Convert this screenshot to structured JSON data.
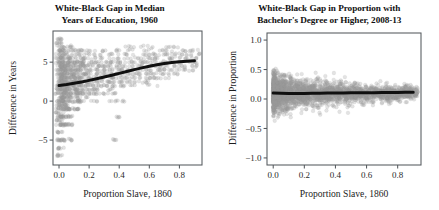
{
  "figure": {
    "width": 439,
    "height": 210,
    "background": "#ffffff",
    "point_color": "#9a9a9a",
    "point_opacity": 0.28,
    "curve_color": "#101010",
    "frame_color": "#555a5e"
  },
  "chart_data": [
    {
      "type": "scatter",
      "panel": "left",
      "title": "White-Black Gap in Median Years of Education, 1960",
      "title_lines": [
        "White-Black Gap in Median",
        "Years of Education, 1960"
      ],
      "xlabel": "Proportion Slave, 1860",
      "ylabel": "Difference in Years",
      "xlim": [
        -0.04,
        0.95
      ],
      "ylim": [
        -8.2,
        9.0
      ],
      "xticks": [
        0.0,
        0.2,
        0.4,
        0.6,
        0.8
      ],
      "xticklabels": [
        "0.0",
        "0.2",
        "0.4",
        "0.6",
        "0.8"
      ],
      "yticks": [
        5,
        0,
        -5
      ],
      "yticklabels": [
        "5",
        "0",
        "-5"
      ],
      "grid": false,
      "legend": null,
      "marker": "circle-open-gray",
      "overlay": {
        "type": "loess",
        "name": "loess smoother",
        "color": "#101010",
        "linewidth": 3.0,
        "x": [
          0.0,
          0.05,
          0.1,
          0.15,
          0.2,
          0.25,
          0.3,
          0.35,
          0.4,
          0.45,
          0.5,
          0.55,
          0.6,
          0.65,
          0.7,
          0.75,
          0.8,
          0.85,
          0.9
        ],
        "y": [
          2.0,
          2.12,
          2.28,
          2.46,
          2.66,
          2.88,
          3.1,
          3.33,
          3.56,
          3.8,
          4.04,
          4.27,
          4.48,
          4.66,
          4.82,
          4.95,
          5.05,
          5.12,
          5.18
        ]
      },
      "note": "Points lie on discrete half-year bands; density is greatest near x=0 and along y = 1 to 5.",
      "points": [
        [
          0.002,
          8.0
        ],
        [
          0.004,
          7.5
        ],
        [
          0.003,
          7.0
        ],
        [
          0.006,
          6.5
        ],
        [
          0.005,
          6.0
        ],
        [
          0.004,
          5.5
        ],
        [
          0.003,
          5.0
        ],
        [
          0.007,
          4.5
        ],
        [
          0.002,
          4.0
        ],
        [
          0.005,
          3.5
        ],
        [
          0.004,
          3.0
        ],
        [
          0.006,
          2.5
        ],
        [
          0.003,
          2.0
        ],
        [
          0.005,
          1.5
        ],
        [
          0.004,
          1.0
        ],
        [
          0.007,
          0.5
        ],
        [
          0.002,
          0.0
        ],
        [
          0.006,
          -0.5
        ],
        [
          0.004,
          -1.0
        ],
        [
          0.003,
          -1.5
        ],
        [
          0.005,
          -2.0
        ],
        [
          0.004,
          -2.5
        ],
        [
          0.006,
          -3.0
        ],
        [
          0.003,
          -4.0
        ],
        [
          0.005,
          -5.0
        ],
        [
          0.004,
          -6.0
        ],
        [
          0.006,
          -7.0
        ],
        [
          0.02,
          6.5
        ],
        [
          0.02,
          5.5
        ],
        [
          0.02,
          5.0
        ],
        [
          0.02,
          4.5
        ],
        [
          0.02,
          4.0
        ],
        [
          0.02,
          3.5
        ],
        [
          0.02,
          3.0
        ],
        [
          0.02,
          2.5
        ],
        [
          0.02,
          2.0
        ],
        [
          0.02,
          1.5
        ],
        [
          0.02,
          1.0
        ],
        [
          0.02,
          0.5
        ],
        [
          0.02,
          0.0
        ],
        [
          0.02,
          -0.5
        ],
        [
          0.02,
          -1.0
        ],
        [
          0.02,
          -2.0
        ],
        [
          0.02,
          -3.0
        ],
        [
          0.02,
          -5.0
        ],
        [
          0.04,
          6.0
        ],
        [
          0.04,
          5.0
        ],
        [
          0.04,
          4.5
        ],
        [
          0.04,
          4.0
        ],
        [
          0.04,
          3.5
        ],
        [
          0.04,
          3.0
        ],
        [
          0.04,
          2.5
        ],
        [
          0.04,
          2.0
        ],
        [
          0.04,
          1.5
        ],
        [
          0.04,
          1.0
        ],
        [
          0.04,
          0.5
        ],
        [
          0.04,
          0.0
        ],
        [
          0.04,
          -0.5
        ],
        [
          0.04,
          -1.0
        ],
        [
          0.04,
          -2.0
        ],
        [
          0.04,
          -3.0
        ],
        [
          0.06,
          7.0
        ],
        [
          0.06,
          5.5
        ],
        [
          0.06,
          5.0
        ],
        [
          0.06,
          4.5
        ],
        [
          0.06,
          4.0
        ],
        [
          0.06,
          3.5
        ],
        [
          0.06,
          3.0
        ],
        [
          0.06,
          2.5
        ],
        [
          0.06,
          2.0
        ],
        [
          0.06,
          1.5
        ],
        [
          0.06,
          1.0
        ],
        [
          0.06,
          0.5
        ],
        [
          0.06,
          0.0
        ],
        [
          0.06,
          -1.0
        ],
        [
          0.06,
          -2.0
        ],
        [
          0.06,
          -5.0
        ],
        [
          0.09,
          6.5
        ],
        [
          0.09,
          5.5
        ],
        [
          0.09,
          5.0
        ],
        [
          0.09,
          4.5
        ],
        [
          0.09,
          4.0
        ],
        [
          0.09,
          3.5
        ],
        [
          0.09,
          3.0
        ],
        [
          0.09,
          2.5
        ],
        [
          0.09,
          2.0
        ],
        [
          0.09,
          1.5
        ],
        [
          0.09,
          1.0
        ],
        [
          0.09,
          0.0
        ],
        [
          0.09,
          -1.0
        ],
        [
          0.09,
          -3.0
        ],
        [
          0.12,
          6.0
        ],
        [
          0.12,
          5.0
        ],
        [
          0.12,
          4.5
        ],
        [
          0.12,
          4.0
        ],
        [
          0.12,
          3.5
        ],
        [
          0.12,
          3.0
        ],
        [
          0.12,
          2.5
        ],
        [
          0.12,
          2.0
        ],
        [
          0.12,
          1.5
        ],
        [
          0.12,
          1.0
        ],
        [
          0.12,
          0.5
        ],
        [
          0.12,
          0.0
        ],
        [
          0.12,
          -1.0
        ],
        [
          0.15,
          6.5
        ],
        [
          0.15,
          5.5
        ],
        [
          0.15,
          5.0
        ],
        [
          0.15,
          4.5
        ],
        [
          0.15,
          4.0
        ],
        [
          0.15,
          3.5
        ],
        [
          0.15,
          3.0
        ],
        [
          0.15,
          2.5
        ],
        [
          0.15,
          2.0
        ],
        [
          0.15,
          1.5
        ],
        [
          0.15,
          1.0
        ],
        [
          0.15,
          0.0
        ],
        [
          0.18,
          6.0
        ],
        [
          0.18,
          5.0
        ],
        [
          0.18,
          4.5
        ],
        [
          0.18,
          4.0
        ],
        [
          0.18,
          3.5
        ],
        [
          0.18,
          3.0
        ],
        [
          0.18,
          2.5
        ],
        [
          0.18,
          2.0
        ],
        [
          0.18,
          1.5
        ],
        [
          0.18,
          1.0
        ],
        [
          0.18,
          0.5
        ],
        [
          0.22,
          6.5
        ],
        [
          0.22,
          5.5
        ],
        [
          0.22,
          5.0
        ],
        [
          0.22,
          4.5
        ],
        [
          0.22,
          4.0
        ],
        [
          0.22,
          3.5
        ],
        [
          0.22,
          3.0
        ],
        [
          0.22,
          2.5
        ],
        [
          0.22,
          2.0
        ],
        [
          0.22,
          1.5
        ],
        [
          0.22,
          1.0
        ],
        [
          0.22,
          0.0
        ],
        [
          0.26,
          6.0
        ],
        [
          0.26,
          5.0
        ],
        [
          0.26,
          4.5
        ],
        [
          0.26,
          4.0
        ],
        [
          0.26,
          3.5
        ],
        [
          0.26,
          3.0
        ],
        [
          0.26,
          2.5
        ],
        [
          0.26,
          2.0
        ],
        [
          0.26,
          1.5
        ],
        [
          0.26,
          1.0
        ],
        [
          0.3,
          6.5
        ],
        [
          0.3,
          5.5
        ],
        [
          0.3,
          5.0
        ],
        [
          0.3,
          4.5
        ],
        [
          0.3,
          4.0
        ],
        [
          0.3,
          3.5
        ],
        [
          0.3,
          3.0
        ],
        [
          0.3,
          2.5
        ],
        [
          0.3,
          2.0
        ],
        [
          0.3,
          1.0
        ],
        [
          0.34,
          6.0
        ],
        [
          0.34,
          5.0
        ],
        [
          0.34,
          4.5
        ],
        [
          0.34,
          4.0
        ],
        [
          0.34,
          3.5
        ],
        [
          0.34,
          3.0
        ],
        [
          0.34,
          2.5
        ],
        [
          0.34,
          2.0
        ],
        [
          0.34,
          1.5
        ],
        [
          0.34,
          0.0
        ],
        [
          0.38,
          6.5
        ],
        [
          0.38,
          5.5
        ],
        [
          0.38,
          5.0
        ],
        [
          0.38,
          4.5
        ],
        [
          0.38,
          4.0
        ],
        [
          0.38,
          3.5
        ],
        [
          0.38,
          3.0
        ],
        [
          0.38,
          2.5
        ],
        [
          0.38,
          2.0
        ],
        [
          0.38,
          1.0
        ],
        [
          0.38,
          -2.0
        ],
        [
          0.38,
          -5.0
        ],
        [
          0.42,
          6.0
        ],
        [
          0.42,
          5.0
        ],
        [
          0.42,
          4.5
        ],
        [
          0.42,
          4.0
        ],
        [
          0.42,
          3.5
        ],
        [
          0.42,
          3.0
        ],
        [
          0.42,
          2.5
        ],
        [
          0.42,
          2.0
        ],
        [
          0.42,
          0.0
        ],
        [
          0.46,
          7.0
        ],
        [
          0.46,
          5.5
        ],
        [
          0.46,
          5.0
        ],
        [
          0.46,
          4.5
        ],
        [
          0.46,
          4.0
        ],
        [
          0.46,
          3.5
        ],
        [
          0.46,
          3.0
        ],
        [
          0.46,
          2.5
        ],
        [
          0.46,
          2.0
        ],
        [
          0.5,
          6.5
        ],
        [
          0.5,
          6.0
        ],
        [
          0.5,
          5.0
        ],
        [
          0.5,
          4.5
        ],
        [
          0.5,
          4.0
        ],
        [
          0.5,
          3.5
        ],
        [
          0.5,
          3.0
        ],
        [
          0.5,
          2.5
        ],
        [
          0.54,
          7.0
        ],
        [
          0.54,
          5.5
        ],
        [
          0.54,
          5.0
        ],
        [
          0.54,
          4.5
        ],
        [
          0.54,
          4.0
        ],
        [
          0.54,
          3.5
        ],
        [
          0.54,
          3.0
        ],
        [
          0.54,
          2.5
        ],
        [
          0.58,
          6.5
        ],
        [
          0.58,
          6.0
        ],
        [
          0.58,
          5.5
        ],
        [
          0.58,
          5.0
        ],
        [
          0.58,
          4.5
        ],
        [
          0.58,
          4.0
        ],
        [
          0.58,
          3.5
        ],
        [
          0.58,
          3.0
        ],
        [
          0.58,
          2.5
        ],
        [
          0.62,
          7.0
        ],
        [
          0.62,
          6.0
        ],
        [
          0.62,
          5.5
        ],
        [
          0.62,
          5.0
        ],
        [
          0.62,
          4.5
        ],
        [
          0.62,
          4.0
        ],
        [
          0.62,
          3.5
        ],
        [
          0.62,
          3.0
        ],
        [
          0.62,
          2.0
        ],
        [
          0.66,
          6.5
        ],
        [
          0.66,
          6.0
        ],
        [
          0.66,
          5.5
        ],
        [
          0.66,
          5.0
        ],
        [
          0.66,
          4.5
        ],
        [
          0.66,
          4.0
        ],
        [
          0.66,
          3.5
        ],
        [
          0.66,
          3.0
        ],
        [
          0.7,
          7.0
        ],
        [
          0.7,
          6.0
        ],
        [
          0.7,
          5.5
        ],
        [
          0.7,
          5.0
        ],
        [
          0.7,
          4.5
        ],
        [
          0.7,
          4.0
        ],
        [
          0.7,
          3.5
        ],
        [
          0.7,
          3.0
        ],
        [
          0.74,
          6.5
        ],
        [
          0.74,
          6.0
        ],
        [
          0.74,
          5.5
        ],
        [
          0.74,
          5.0
        ],
        [
          0.74,
          4.5
        ],
        [
          0.74,
          4.0
        ],
        [
          0.74,
          3.5
        ],
        [
          0.78,
          7.0
        ],
        [
          0.78,
          6.0
        ],
        [
          0.78,
          5.5
        ],
        [
          0.78,
          5.0
        ],
        [
          0.78,
          4.5
        ],
        [
          0.78,
          4.0
        ],
        [
          0.78,
          3.5
        ],
        [
          0.82,
          6.5
        ],
        [
          0.82,
          6.0
        ],
        [
          0.82,
          5.5
        ],
        [
          0.82,
          5.0
        ],
        [
          0.82,
          4.5
        ],
        [
          0.82,
          4.0
        ],
        [
          0.86,
          6.5
        ],
        [
          0.86,
          6.0
        ],
        [
          0.86,
          5.5
        ],
        [
          0.86,
          5.0
        ],
        [
          0.86,
          4.5
        ],
        [
          0.86,
          4.0
        ],
        [
          0.9,
          6.5
        ],
        [
          0.9,
          6.0
        ],
        [
          0.9,
          5.5
        ],
        [
          0.9,
          5.0
        ],
        [
          0.9,
          4.5
        ]
      ]
    },
    {
      "type": "scatter",
      "panel": "right",
      "title": "White-Black Gap in Proportion with Bachelor's Degree or Higher, 2008-13",
      "title_lines": [
        "White-Black Gap in Proportion with",
        "Bachelor's Degree or Higher, 2008-13"
      ],
      "xlabel": "Proportion Slave, 1860",
      "ylabel": "Difference in Proportion",
      "xlim": [
        -0.04,
        0.95
      ],
      "ylim": [
        -1.12,
        1.12
      ],
      "xticks": [
        0.0,
        0.2,
        0.4,
        0.6,
        0.8
      ],
      "xticklabels": [
        "0.0",
        "0.2",
        "0.4",
        "0.6",
        "0.8"
      ],
      "yticks": [
        1.0,
        0.5,
        0.0,
        -0.5,
        -1.0
      ],
      "yticklabels": [
        "1.0",
        "0.5",
        "0.0",
        "-0.5",
        "-1.0"
      ],
      "grid": false,
      "legend": null,
      "marker": "circle-open-gray",
      "overlay": {
        "type": "loess",
        "name": "loess smoother",
        "color": "#101010",
        "linewidth": 3.0,
        "x": [
          0.0,
          0.05,
          0.1,
          0.15,
          0.2,
          0.25,
          0.3,
          0.35,
          0.4,
          0.45,
          0.5,
          0.55,
          0.6,
          0.65,
          0.7,
          0.75,
          0.8,
          0.85,
          0.9
        ],
        "y": [
          0.1,
          0.096,
          0.094,
          0.094,
          0.095,
          0.096,
          0.098,
          0.1,
          0.101,
          0.103,
          0.104,
          0.105,
          0.107,
          0.108,
          0.11,
          0.111,
          0.112,
          0.113,
          0.114
        ]
      },
      "note": "Dense cloud concentrated around y = 0.1 with scatter widest near x = 0; spread narrows as x increases.",
      "scatter_spread": {
        "center": 0.1,
        "sd_at_x0": 0.17,
        "sd_at_x09": 0.05,
        "min_outlier": -0.9,
        "max_outlier": 0.58
      }
    }
  ]
}
